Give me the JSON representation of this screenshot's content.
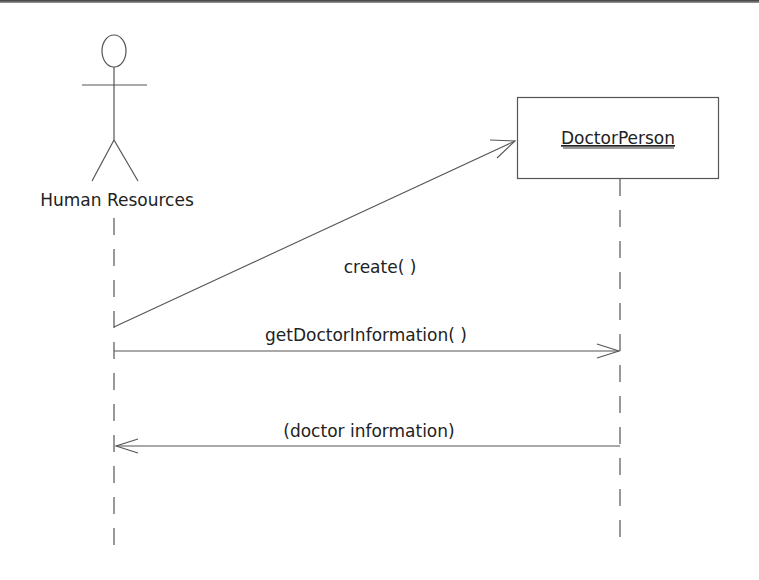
{
  "diagram": {
    "type": "sequence",
    "actor": {
      "name": "Human Resources",
      "kind": "actor"
    },
    "object": {
      "name": "DoctorPerson",
      "kind": "object",
      "underlined": true
    },
    "messages": [
      {
        "label": "create( )",
        "from": "Human Resources",
        "to": "DoctorPerson",
        "kind": "create"
      },
      {
        "label": "getDoctorInformation( )",
        "from": "Human Resources",
        "to": "DoctorPerson",
        "kind": "call"
      },
      {
        "label": "(doctor information)",
        "from": "DoctorPerson",
        "to": "Human Resources",
        "kind": "return"
      }
    ],
    "colors": {
      "stroke": "#555555",
      "text": "#222222",
      "background": "#ffffff"
    }
  }
}
